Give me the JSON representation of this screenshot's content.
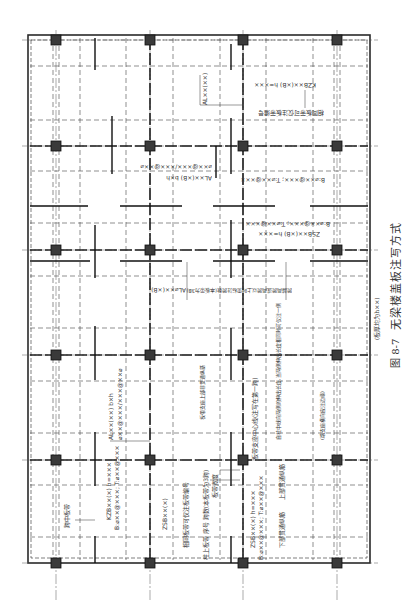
{
  "figure": {
    "number": "图 8-7",
    "title": "无梁楼盖板注写方式",
    "note": "(板厚均为h××)"
  },
  "grid": {
    "columns_x": [
      56,
      150,
      243,
      337
    ],
    "rows_y": [
      40,
      146,
      250,
      355,
      460,
      563
    ]
  },
  "annotations": {
    "kzb_top": "KZB××(×B)  h=×××",
    "kzb_top_2": "B:⌀××@×××; T:⌀××@×××",
    "kzb_note": "相同板带可仅注板带编号",
    "al_top": "AL××(××)",
    "al_mid": "AL××(×B) b×h",
    "al_mid_rebar": "⌀××@×××/×××@××⌀",
    "zsb_mid": "ZSB××(×B)  h=×××",
    "zsb_mid_2": "B:⌀××@×××; T:⌀××@×××",
    "al_note": "AL⌀××(×B)",
    "al_cross_note": "跨越两跨或两跨以上时需标注跨数(本板带为3B)",
    "span_band": "跨中板带",
    "kzb_bottom": "KZB××(×)  h=×××",
    "kzb_bottom_2": "B:⌀××@×××; T:⌀××@×××",
    "al_bottom": "AL××(××)  b×h",
    "al_bottom_rebar": "⌀××@×××/×××@××⌀",
    "zsb_bottom": "ZSB××(×)",
    "zsb_bottom_2": "ZSB××(×)  h=×××",
    "zsb_bottom_3": "B:⌀××@×××; T:⌀××@×××",
    "same_band": "相同板带可仅注板带编号",
    "col_band_seq": "柱上板带  序号  跨数(本板带为3跨)",
    "band_width": "板带宽度",
    "bottom_rebar": "下部贯通纵筋",
    "top_rebar": "上部贯通纵筋",
    "center_note": "板带支座中心线(注写在第一跨)",
    "extend_note": "自柱中线向两侧的伸出长度,当两侧伸出长度相同时可仅注一侧",
    "support_note": "板带支座上部非贯通纵筋",
    "edge_note": "(端支座横向应注边缘)",
    "rebar_short": "××⌀××",
    "rebar_spec": "××⌀×××",
    "rebar_xxxx": "××××",
    "circle_labels": [
      "①",
      "②",
      "③",
      "④",
      "⑤",
      "⑥",
      "⑦",
      "⑧",
      "⑨"
    ]
  },
  "colors": {
    "line": "#2a2a2a",
    "column": "#3a3a3a",
    "text": "#333333"
  }
}
